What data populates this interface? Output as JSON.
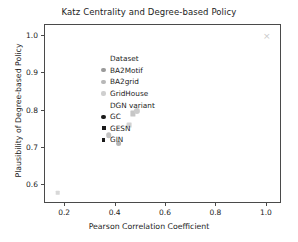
{
  "chart_data": {
    "type": "scatter",
    "title": "Katz Centrality and Degree-based Policy",
    "xlabel": "Pearson Correlation Coefficient",
    "ylabel": "Plausibility of Degree-based Policy",
    "xlim": [
      0.12,
      1.06
    ],
    "ylim": [
      0.55,
      1.03
    ],
    "xticks": [
      0.2,
      0.4,
      0.6,
      0.8,
      1.0
    ],
    "xtick_labels": [
      "0.2",
      "0.4",
      "0.6",
      "0.8",
      "1.0"
    ],
    "yticks": [
      0.6,
      0.7,
      0.8,
      0.9,
      1.0
    ],
    "ytick_labels": [
      "0.6",
      "0.7",
      "0.8",
      "0.9",
      "1.0"
    ],
    "grid": false,
    "legend_position": "upper left",
    "points": [
      {
        "x": 0.17,
        "y": 0.58,
        "marker": "square",
        "color": "#d8d8d8",
        "size": 4.6,
        "dataset": "GridHouse",
        "variant": "GESN"
      },
      {
        "x": 0.372,
        "y": 0.735,
        "marker": "circle",
        "color": "#c2c2c2",
        "size": 5.6,
        "dataset": "BA2grid",
        "variant": "GC"
      },
      {
        "x": 0.412,
        "y": 0.712,
        "marker": "circle",
        "color": "#b4b4b4",
        "size": 5.8,
        "dataset": "BA2Motif",
        "variant": "GC"
      },
      {
        "x": 0.455,
        "y": 0.762,
        "marker": "square",
        "color": "#d2d2d2",
        "size": 4.8,
        "dataset": "GridHouse",
        "variant": "GESN"
      },
      {
        "x": 0.47,
        "y": 0.793,
        "marker": "square",
        "color": "#c6c6c6",
        "size": 5.2,
        "dataset": "BA2grid",
        "variant": "GESN"
      },
      {
        "x": 0.483,
        "y": 0.8,
        "marker": "circle",
        "color": "#cccccc",
        "size": 6.2,
        "dataset": "GridHouse",
        "variant": "GC"
      },
      {
        "x": 1.0,
        "y": 1.0,
        "marker": "cross",
        "color": "#c9c9c9",
        "size": 6.0,
        "dataset": "GridHouse",
        "variant": "GIN"
      }
    ],
    "legend": {
      "groups": [
        {
          "title": "Dataset",
          "entries": [
            {
              "label": "BA2Motif",
              "marker": "circle",
              "color": "#9a9a9a",
              "size": 4.2
            },
            {
              "label": "BA2grid",
              "marker": "circle",
              "color": "#b8b8b8",
              "size": 4.2
            },
            {
              "label": "GridHouse",
              "marker": "circle",
              "color": "#cfcfcf",
              "size": 4.2
            }
          ]
        },
        {
          "title": "DGN variant",
          "entries": [
            {
              "label": "GC",
              "marker": "circle",
              "color": "#1a1a1a",
              "size": 4.4
            },
            {
              "label": "GESN",
              "marker": "square",
              "color": "#1a1a1a",
              "size": 4.0
            },
            {
              "label": "GIN",
              "marker": "square",
              "color": "#1a1a1a",
              "size": 3.4
            }
          ]
        }
      ]
    },
    "colors": {
      "axis": "#4a4a4a",
      "text": "#1c1c1c",
      "background": "#ffffff"
    }
  }
}
